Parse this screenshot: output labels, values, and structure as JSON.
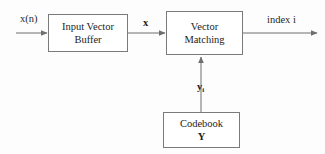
{
  "diagram": {
    "background_color": "#fdfdfd",
    "line_color": "#6f6f6f",
    "text_color": "#1d1d1d",
    "blocks": [
      {
        "id": "input-vector-buffer",
        "line1": "Input Vector",
        "line2": "Buffer"
      },
      {
        "id": "vector-matching",
        "line1": "Vector",
        "line2": "Matching"
      },
      {
        "id": "codebook",
        "line1": "Codebook",
        "line2": "Y"
      }
    ],
    "labels": {
      "input_signal": "x(n)",
      "vector_x": "x",
      "output_index": "index i",
      "codeword_base": "y",
      "codeword_subscript": "i"
    }
  }
}
